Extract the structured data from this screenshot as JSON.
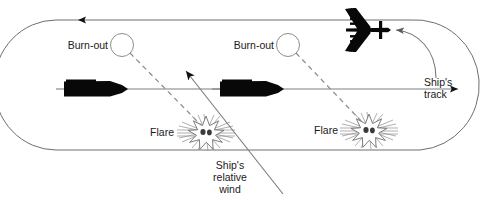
{
  "diagram": {
    "background_color": "#ffffff",
    "line_color": "#7f7f7f",
    "curve_color": "#6e6e6e",
    "silhouette_color": "#080808",
    "text_color": "#1a1a1a"
  },
  "labels": {
    "burn_out_left": "Burn-out",
    "burn_out_right": "Burn-out",
    "flare_left": "Flare",
    "flare_right": "Flare",
    "ships_track_line1": "Ship's",
    "ships_track_line2": "track",
    "relative_wind_line1": "Ship's",
    "relative_wind_line2": "relative",
    "relative_wind_line3": "wind"
  },
  "elements": {
    "ship_left": "ship-silhouette",
    "ship_right": "ship-silhouette",
    "aircraft": "aircraft-silhouette",
    "flare_left_symbol": "flare-burst-icon",
    "flare_right_symbol": "flare-burst-icon",
    "burn_out_left_symbol": "burn-out-circle",
    "burn_out_right_symbol": "burn-out-circle",
    "track_loop": "racetrack-oval-path",
    "aircraft_approach_arrow": "curved-approach-arrow",
    "wind_arrow": "relative-wind-arrow",
    "track_arrow": "ships-track-arrow",
    "return_arrow": "track-return-arrow"
  }
}
